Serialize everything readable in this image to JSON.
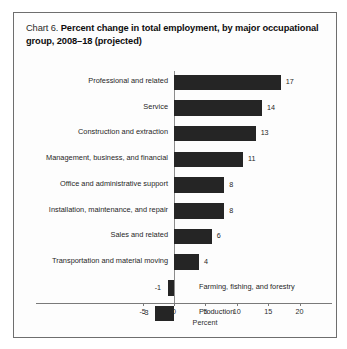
{
  "chart": {
    "label": "Chart 6.",
    "title": "Percent change in total employment, by major occupational group, 2008–18 (projected)"
  },
  "chart_data": {
    "type": "bar",
    "orientation": "horizontal",
    "title": "Percent change in total employment, by major occupational group, 2008–18 (projected)",
    "xlabel": "Percent",
    "ylabel": "",
    "xlim": [
      -5,
      20
    ],
    "xticks": [
      -5,
      0,
      5,
      10,
      15,
      20
    ],
    "xticklabels": [
      "-5",
      "0",
      "5",
      "10",
      "15",
      "20"
    ],
    "grid": false,
    "legend": false,
    "bar_color": "#252525",
    "categories": [
      "Professional and related",
      "Service",
      "Construction and extraction",
      "Management, business, and financial",
      "Office and administrative support",
      "Installation, maintenance, and repair",
      "Sales and related",
      "Transportation and material moving",
      "Farming, fishing, and forestry",
      "Production"
    ],
    "values": [
      17,
      14,
      13,
      11,
      8,
      8,
      6,
      4,
      -1,
      -3
    ],
    "data_labels": [
      "17",
      "14",
      "13",
      "11",
      "8",
      "8",
      "6",
      "4",
      "-1",
      "-3"
    ]
  }
}
